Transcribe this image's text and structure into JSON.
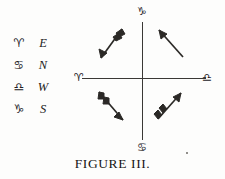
{
  "figure": {
    "caption": "FIGURE III.",
    "legend": {
      "rows": [
        {
          "symbol": "♈",
          "symbol_name": "aries-symbol",
          "direction": "E"
        },
        {
          "symbol": "♋",
          "symbol_name": "cancer-symbol",
          "direction": "N"
        },
        {
          "symbol": "♎",
          "symbol_name": "libra-symbol",
          "direction": "W"
        },
        {
          "symbol": "♑",
          "symbol_name": "capricorn-symbol",
          "direction": "S"
        }
      ]
    },
    "axes": {
      "top_label": "♑",
      "bottom_label": "♋",
      "left_label": "♈",
      "right_label": "♎"
    },
    "arrows": [
      {
        "name": "arrow-upper-left",
        "quadrant": "upper-left",
        "direction": "down-left"
      },
      {
        "name": "arrow-upper-right",
        "quadrant": "upper-right",
        "direction": "up-left"
      },
      {
        "name": "arrow-lower-left",
        "quadrant": "lower-left",
        "direction": "down-right"
      },
      {
        "name": "arrow-lower-right",
        "quadrant": "lower-right",
        "direction": "up-right"
      }
    ],
    "colors": {
      "ink": "#23211f",
      "paper": "#fdfdfc",
      "axis": "#3a3835"
    }
  }
}
